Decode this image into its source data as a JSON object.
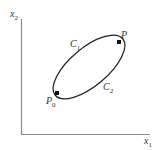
{
  "diagram": {
    "axes": {
      "y_label": "x",
      "y_label_sub": "2",
      "x_label": "x",
      "x_label_sub": "1",
      "color": "#8a8a8a"
    },
    "curves": [
      {
        "label": "C",
        "sub": "1"
      },
      {
        "label": "C",
        "sub": "2"
      }
    ],
    "points": [
      {
        "label": "P",
        "sub": ""
      },
      {
        "label": "P",
        "sub": "0"
      }
    ],
    "curve_color": "#222222"
  }
}
